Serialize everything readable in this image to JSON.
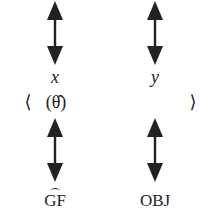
{
  "diagram": {
    "top_left": {
      "label": "x",
      "italic": true
    },
    "top_right": {
      "label": "y",
      "italic": true
    },
    "middle": {
      "open_bracket": "⟨",
      "theta": "(θ̂)",
      "close_bracket": "⟩"
    },
    "bottom_left": {
      "label": "GF",
      "hatted": true
    },
    "bottom_right": {
      "label": "OBJ"
    },
    "arrows": [
      {
        "id": "top-left",
        "direction": "bidirectional-vertical"
      },
      {
        "id": "top-right",
        "direction": "bidirectional-vertical"
      },
      {
        "id": "bottom-left",
        "direction": "bidirectional-vertical"
      },
      {
        "id": "bottom-right",
        "direction": "bidirectional-vertical"
      }
    ],
    "colors": {
      "ink": "#222222",
      "background": "#ffffff"
    }
  }
}
